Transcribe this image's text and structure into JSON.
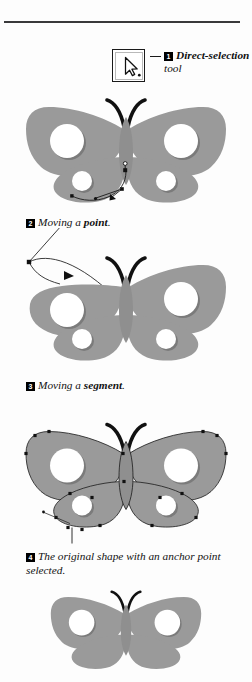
{
  "page": {
    "background_color": "#fdfdfd",
    "width": 252,
    "height": 682,
    "rule_color": "#39393b"
  },
  "tool_callout": {
    "icon_name": "direct-selection-arrow-icon",
    "leader_line": true,
    "badge": "1",
    "label_bold": "Direct-selection",
    "label_rest": " tool",
    "label_full": "Direct-selection tool"
  },
  "captions": [
    {
      "badge": "2",
      "text_plain": "Moving a point.",
      "lead": "Moving a ",
      "bold": "point",
      "tail": "."
    },
    {
      "badge": "3",
      "text_plain": "Moving a segment.",
      "lead": "Moving a ",
      "bold": "segment",
      "tail": "."
    },
    {
      "badge": "4",
      "text_plain": "The original shape with an anchor point selected.",
      "lead": "The original shape with an anchor point selected.",
      "bold": "",
      "tail": ""
    }
  ],
  "figures": [
    {
      "name": "butterfly-moving-a-point",
      "caption_ref": "2",
      "state": "anchor point dragged on lower-left wing",
      "wing_fill": "#9a9a9a",
      "wing_shadow": "#7b7b7b",
      "antenna_color": "#111111",
      "path_stroke": "#1a1a1a",
      "anchors_visible": true
    },
    {
      "name": "butterfly-moving-a-segment",
      "caption_ref": "3",
      "state": "upper-left wing segment pulled far out to the upper left",
      "wing_fill": "#9a9a9a",
      "wing_shadow": "#7b7b7b",
      "antenna_color": "#111111",
      "path_stroke": "#1a1a1a",
      "anchors_visible": true
    },
    {
      "name": "butterfly-original-shape-anchor-selected",
      "caption_ref": "4",
      "state": "full outline path with all anchor points shown",
      "wing_fill": "#9a9a9a",
      "wing_shadow": "#7b7b7b",
      "antenna_color": "#111111",
      "path_stroke": "#1a1a1a",
      "anchors_visible": true
    },
    {
      "name": "butterfly-plain-cropped",
      "caption_ref": "",
      "state": "plain shape, cropped by page edge",
      "wing_fill": "#9a9a9a",
      "wing_shadow": "#7b7b7b",
      "antenna_color": "#111111",
      "path_stroke": "none",
      "anchors_visible": false
    }
  ],
  "colors": {
    "wing_gray": "#9a9a9a",
    "wing_shadow": "#7b7b7b",
    "ink_black": "#111111",
    "paper": "#fdfdfd"
  }
}
